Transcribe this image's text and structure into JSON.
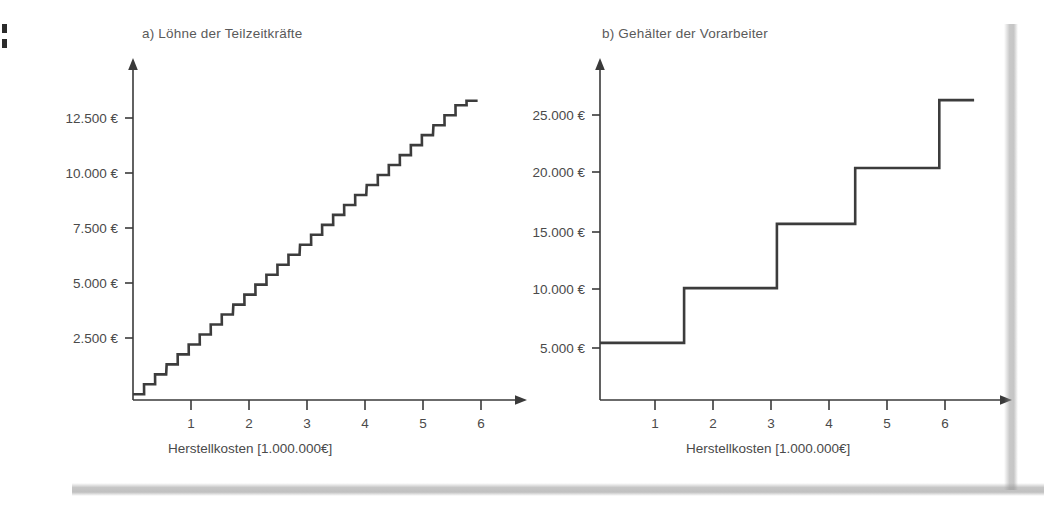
{
  "figure": {
    "background_color": "#ffffff",
    "line_color": "#3c3c3c",
    "text_color": "#4a4a4a"
  },
  "charts": [
    {
      "id": "a",
      "title": "a) Löhne der Teilzeitkräfte",
      "xlabel": "Herstellkosten [1.000.000€]",
      "ylabel": "",
      "xticks": [
        "1",
        "2",
        "3",
        "4",
        "5",
        "6"
      ],
      "yticks": [
        "2.500 €",
        "5.000 €",
        "7.500 €",
        "10.000 €",
        "12.500 €"
      ]
    },
    {
      "id": "b",
      "title": "b) Gehälter der Vorarbeiter",
      "xlabel": "Herstellkosten [1.000.000€]",
      "ylabel": "",
      "xticks": [
        "1",
        "2",
        "3",
        "4",
        "5",
        "6"
      ],
      "yticks": [
        "5.000 €",
        "10.000 €",
        "15.000 €",
        "20.000 €",
        "25.000 €"
      ]
    }
  ],
  "chart_data": [
    {
      "type": "line",
      "variant": "step",
      "id": "a",
      "title": "a) Löhne der Teilzeitkräfte",
      "xlabel": "Herstellkosten [1.000.000€]",
      "ylabel": "",
      "xlim": [
        0,
        6.6
      ],
      "ylim": [
        0,
        14500
      ],
      "xticks": [
        1,
        2,
        3,
        4,
        5,
        6
      ],
      "xticklabels": [
        "1",
        "2",
        "3",
        "4",
        "5",
        "6"
      ],
      "yticks": [
        2500,
        5000,
        7500,
        10000,
        12500
      ],
      "yticklabels": [
        "2.500 €",
        "5.000 €",
        "7.500 €",
        "10.000 €",
        "12.500 €"
      ],
      "grid": false,
      "legend": null,
      "description": "Feine Treppenfunktion mit 30 gleich großen Stufen von ca. 450 € je Stufe, annähernd linear steigend bis ca. 13.600 € bei 5,75 Mio. € Herstellkosten.",
      "step_width": 0.1917,
      "step_height": 453,
      "x": [
        0.0,
        0.19,
        0.38,
        0.58,
        0.77,
        0.96,
        1.15,
        1.34,
        1.53,
        1.73,
        1.92,
        2.11,
        2.3,
        2.49,
        2.68,
        2.88,
        3.07,
        3.26,
        3.45,
        3.64,
        3.83,
        4.03,
        4.22,
        4.41,
        4.6,
        4.79,
        4.98,
        5.18,
        5.37,
        5.56,
        5.75
      ],
      "y": [
        260,
        713,
        1166,
        1619,
        2072,
        2525,
        2978,
        3431,
        3884,
        4337,
        4790,
        5243,
        5696,
        6149,
        6602,
        7055,
        7508,
        7961,
        8414,
        8867,
        9320,
        9773,
        10226,
        10679,
        11132,
        11585,
        12038,
        12491,
        12944,
        13397,
        13600
      ]
    },
    {
      "type": "line",
      "variant": "step",
      "id": "b",
      "title": "b) Gehälter der Vorarbeiter",
      "xlabel": "Herstellkosten [1.000.000€]",
      "ylabel": "",
      "xlim": [
        0,
        6.8
      ],
      "ylim": [
        0,
        27000
      ],
      "xticks": [
        1,
        2,
        3,
        4,
        5,
        6
      ],
      "xticklabels": [
        "1",
        "2",
        "3",
        "4",
        "5",
        "6"
      ],
      "yticks": [
        5000,
        10000,
        15000,
        20000,
        25000
      ],
      "yticklabels": [
        "5.000 €",
        "10.000 €",
        "15.000 €",
        "20.000 €",
        "25.000 €"
      ],
      "grid": false,
      "legend": null,
      "description": "Grobe Treppenfunktion (Sprungfunktion) mit 5 Stufen; Sprünge bei ca. 1,45, 3,05, 4,40 und 5,85 Mio. € Herstellkosten.",
      "steps": [
        {
          "x_start": 0.0,
          "x_end": 1.45,
          "value": 4800
        },
        {
          "x_start": 1.45,
          "x_end": 3.05,
          "value": 9400
        },
        {
          "x_start": 3.05,
          "x_end": 4.4,
          "value": 14800
        },
        {
          "x_start": 4.4,
          "x_end": 5.85,
          "value": 19500
        },
        {
          "x_start": 5.85,
          "x_end": 6.45,
          "value": 25200
        }
      ],
      "jump_positions": [
        1.45,
        3.05,
        4.4,
        5.85
      ],
      "levels": [
        4800,
        9400,
        14800,
        19500,
        25200
      ]
    }
  ]
}
